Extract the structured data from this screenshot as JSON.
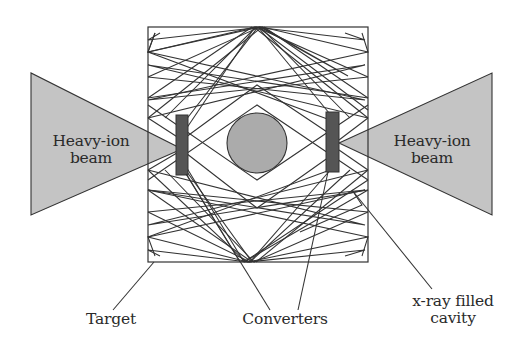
{
  "figure": {
    "type": "schematic"
  },
  "colors": {
    "background": "#ffffff",
    "stroke": "#333333",
    "beam_fill": "#c4c4c4",
    "converter_fill": "#555555",
    "capsule_fill": "#ababab",
    "text": "#2a2a2a"
  },
  "beams": {
    "left": {
      "label_line1": "Heavy-ion",
      "label_line2": "beam"
    },
    "right": {
      "label_line1": "Heavy-ion",
      "label_line2": "beam"
    }
  },
  "callouts": {
    "target": {
      "label": "Target"
    },
    "converters": {
      "label": "Converters"
    },
    "cavity": {
      "label_line1": "x-ray filled",
      "label_line2": "cavity"
    }
  },
  "components": [
    "cavity-box",
    "left-heavy-ion-beam",
    "right-heavy-ion-beam",
    "left-converter",
    "right-converter",
    "central-capsule",
    "x-ray-paths"
  ]
}
